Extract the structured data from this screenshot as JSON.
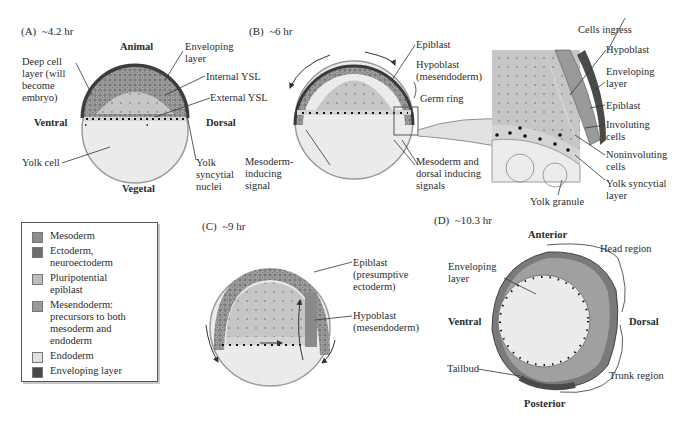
{
  "panels": {
    "A": {
      "title": "(A)  ~4.2 hr",
      "orientation": {
        "top": "Animal",
        "bottom": "Vegetal",
        "left": "Ventral",
        "right": "Dorsal"
      },
      "labels": {
        "deep_cell": "Deep cell\nlayer (will\nbecome\nembryo)",
        "enveloping": "Enveloping\nlayer",
        "internal_ysl": "Internal YSL",
        "external_ysl": "External YSL",
        "yolk_cell": "Yolk cell",
        "yolk_nuclei": "Yolk\nsyncytial\nnuclei"
      }
    },
    "B": {
      "title": "(B)  ~6 hr",
      "labels": {
        "epiblast": "Epiblast",
        "hypoblast": "Hypoblast\n(mesendoderm)",
        "germ_ring": "Germ ring",
        "mesoderm_inducing": "Mesoderm-\ninducing\nsignal",
        "dorsal_inducing": "Mesoderm and\ndorsal inducing\nsignals"
      },
      "inset": {
        "cells_ingress": "Cells ingress",
        "hypoblast": "Hypoblast",
        "enveloping": "Enveloping\nlayer",
        "epiblast": "Epiblast",
        "involuting": "Involuting\ncells",
        "noninvoluting": "Noninvoluting\ncells",
        "ysl": "Yolk syncytial\nlayer",
        "yolk_granule": "Yolk granule"
      }
    },
    "C": {
      "title": "(C)  ~9 hr",
      "labels": {
        "epiblast": "Epiblast\n(presumptive\nectoderm)",
        "hypoblast": "Hypoblast\n(mesendoderm)"
      }
    },
    "D": {
      "title": "(D)  ~10.3 hr",
      "orientation": {
        "top": "Anterior",
        "bottom": "Posterior",
        "left": "Ventral",
        "right": "Dorsal"
      },
      "labels": {
        "head_region": "Head region",
        "enveloping": "Enveloping\nlayer",
        "tailbud": "Tailbud",
        "trunk_region": "Trunk region"
      }
    }
  },
  "legend": {
    "items": [
      {
        "label": "Mesoderm",
        "color": "#8e8e8e"
      },
      {
        "label": "Ectoderm,\nneuroectoderm",
        "color": "#6f6f6f"
      },
      {
        "label": "Pluripotential\nepiblast",
        "color": "#bdbdbd"
      },
      {
        "label": "Mesendoderm:\nprecursors to both\nmesoderm and\nendoderm",
        "color": "#9a9a9a"
      },
      {
        "label": "Endoderm",
        "color": "#e0e0e0"
      },
      {
        "label": "Enveloping layer",
        "color": "#4a4a4a"
      }
    ]
  },
  "colors": {
    "yolk": "#ececec",
    "blastoderm": "#c4c4c4",
    "deep_cells": "#8a8a8a",
    "enveloping": "#4a4a4a",
    "nuclei": "#1e1e1e",
    "line": "#333333"
  }
}
